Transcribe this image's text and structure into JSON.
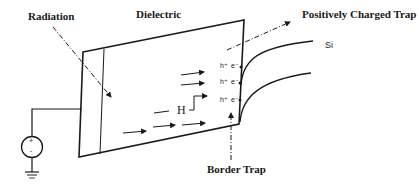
{
  "diagram": {
    "labels": {
      "radiation": "Radiation",
      "dielectric": "Dielectric",
      "positively_charged_trap": "Positively Charged Trap",
      "silicon": "Si",
      "hydrogen": "H",
      "border_trap": "Border Trap"
    },
    "charge_pairs": [
      {
        "hole": "h⁺",
        "electron": "e⁻"
      },
      {
        "hole": "h⁺",
        "electron": "e⁻"
      },
      {
        "hole": "h⁺",
        "electron": "e⁻"
      }
    ],
    "voltage_source": {
      "plus": "+",
      "minus": "-"
    },
    "colors": {
      "line": "#1a1a1a",
      "background": "#ffffff"
    }
  }
}
